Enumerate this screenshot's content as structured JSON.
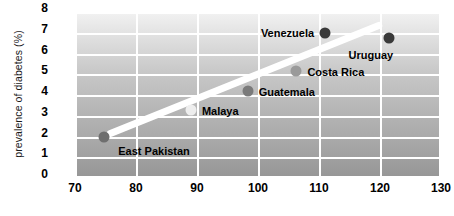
{
  "chart_data": {
    "type": "scatter",
    "title": "",
    "xlabel": "",
    "ylabel": "prevalence of diabetes (%)",
    "xlim": [
      70,
      130
    ],
    "ylim": [
      0,
      8
    ],
    "grid": true,
    "legend": false,
    "xticks": [
      "70",
      "80",
      "90",
      "100",
      "110",
      "120",
      "130"
    ],
    "yticks": [
      "0",
      "1",
      "2",
      "3",
      "4",
      "5",
      "6",
      "7",
      "8"
    ],
    "points": [
      {
        "label": "East Pakistan",
        "x": 74.8,
        "y": 2.0,
        "color": "#6e6e6e",
        "label_side": "right",
        "label_dx": 14,
        "label_dy": 14
      },
      {
        "label": "Malaya",
        "x": 89.0,
        "y": 3.3,
        "color": "#eeeeee",
        "label_side": "right",
        "label_dx": 11,
        "label_dy": 1
      },
      {
        "label": "Guatemala",
        "x": 98.3,
        "y": 4.2,
        "color": "#7a7a7a",
        "label_side": "right",
        "label_dx": 11,
        "label_dy": 1
      },
      {
        "label": "Costa Rica",
        "x": 106.3,
        "y": 5.15,
        "color": "#9a9a9a",
        "label_side": "right",
        "label_dx": 11,
        "label_dy": 1
      },
      {
        "label": "Venezuela",
        "x": 111.0,
        "y": 7.0,
        "color": "#3a3a3a",
        "label_side": "left",
        "label_dx": -11,
        "label_dy": 0
      },
      {
        "label": "Uruguay",
        "x": 121.5,
        "y": 6.75,
        "color": "#3a3a3a",
        "label_side": "left",
        "label_dx": 4,
        "label_dy": 17
      }
    ],
    "trendline": {
      "x_start": 75.8,
      "y_start": 2.15,
      "x_end": 119.8,
      "y_end": 7.35,
      "color": "#ffffff",
      "width": 7
    },
    "colors": {
      "grid": "#ffffff",
      "text": "#000000",
      "plot_bg_top": "#f2f2f2",
      "plot_bg_bottom": "#969696"
    }
  }
}
